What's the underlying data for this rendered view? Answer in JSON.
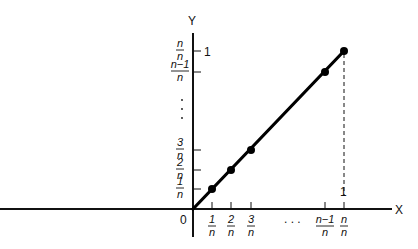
{
  "diagram": {
    "axes": {
      "x_label": "X",
      "y_label": "Y",
      "origin_label": "0"
    },
    "x_ticks": [
      {
        "num": "1",
        "den": "n",
        "value": 1
      },
      {
        "num": "2",
        "den": "n",
        "value": 2
      },
      {
        "num": "3",
        "den": "n",
        "value": 3
      },
      {
        "num": "n−1",
        "den": "n",
        "value": "n-1"
      },
      {
        "num": "n",
        "den": "n",
        "value": "n"
      }
    ],
    "x_ellipsis": ". . .",
    "x_top_label": "1",
    "y_ticks": [
      {
        "num": "1",
        "den": "n",
        "value": 1
      },
      {
        "num": "2",
        "den": "n",
        "value": 2
      },
      {
        "num": "3",
        "den": "n",
        "value": 3
      },
      {
        "num": "n−1",
        "den": "n",
        "value": "n-1"
      },
      {
        "num": "n",
        "den": "n",
        "value": "n"
      }
    ],
    "y_ellipsis": ":",
    "y_right_label": "1",
    "points": [
      {
        "x": "1/n",
        "y": "1/n"
      },
      {
        "x": "2/n",
        "y": "2/n"
      },
      {
        "x": "3/n",
        "y": "3/n"
      },
      {
        "x": "(n-1)/n",
        "y": "(n-1)/n"
      },
      {
        "x": "n/n",
        "y": "n/n"
      }
    ],
    "line": "y = x from (0,0) to (1,1)"
  }
}
